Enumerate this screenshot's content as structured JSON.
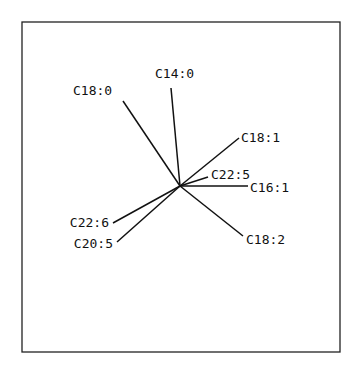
{
  "chart_data": {
    "type": "biplot",
    "title": "",
    "xlabel": "",
    "ylabel": "",
    "xlim": [
      -1.58,
      1.6
    ],
    "ylim": [
      -1.66,
      1.64
    ],
    "grid": false,
    "legend": "none",
    "vectors": [
      {
        "label": "C18:0",
        "x": -0.57,
        "y": 0.85
      },
      {
        "label": "C14:0",
        "x": -0.09,
        "y": 0.98
      },
      {
        "label": "C18:1",
        "x": 0.59,
        "y": 0.48
      },
      {
        "label": "C22:5",
        "x": 0.28,
        "y": 0.09
      },
      {
        "label": "C16:1",
        "x": 0.68,
        "y": 0.0
      },
      {
        "label": "C18:2",
        "x": 0.63,
        "y": -0.5
      },
      {
        "label": "C22:6",
        "x": -0.67,
        "y": -0.37
      },
      {
        "label": "C20:5",
        "x": -0.63,
        "y": -0.56
      }
    ]
  }
}
